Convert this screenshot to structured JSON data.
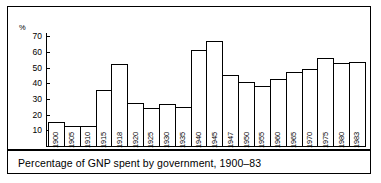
{
  "figure": {
    "caption": "Percentage of GNP spent by government, 1900–83",
    "y_unit_label": "%"
  },
  "chart_data": {
    "type": "bar",
    "title": "Percentage of GNP spent by government, 1900–83",
    "xlabel": "",
    "ylabel": "%",
    "ylim": [
      0,
      72
    ],
    "yticks": [
      10,
      20,
      30,
      40,
      50,
      60,
      70
    ],
    "ytick_labels": [
      "10",
      "20",
      "30",
      "40",
      "50",
      "60",
      "70"
    ],
    "grid": false,
    "legend": null,
    "bar_style": {
      "fill": "#ffffff",
      "edge": "#000000",
      "gap": 0
    },
    "categories": [
      "1900",
      "1905",
      "1910",
      "1915",
      "1918",
      "1920",
      "1925",
      "1930",
      "1935",
      "1940",
      "1945",
      "1947",
      "1950",
      "1955",
      "1960",
      "1965",
      "1970",
      "1975",
      "1980",
      "1983"
    ],
    "values": [
      15,
      13,
      13,
      35.5,
      52,
      27.5,
      24.5,
      27,
      25,
      61,
      67,
      45.5,
      40.5,
      38,
      43,
      47,
      49,
      56,
      53,
      53.5
    ]
  }
}
